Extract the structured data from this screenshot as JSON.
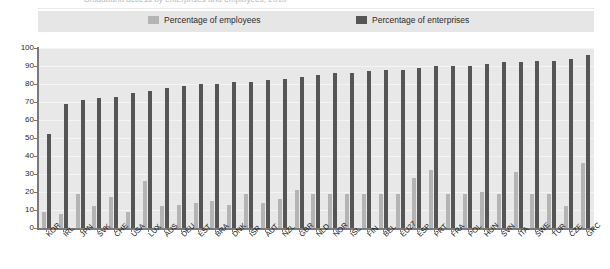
{
  "figure": {
    "cut_off_title": "Broadband access by enterprises and employees, 2010",
    "legend": [
      {
        "label": "Percentage of employees",
        "color": "#b4b4b4",
        "key": "employees"
      },
      {
        "label": "Percentage of enterprises",
        "color": "#555555",
        "key": "enterprises"
      }
    ]
  },
  "chart_data": {
    "type": "bar",
    "title": "Broadband access by enterprises and employees, 2010",
    "xlabel": "",
    "ylabel": "",
    "ylim": [
      0,
      100
    ],
    "yticks": [
      0,
      10,
      20,
      30,
      40,
      50,
      60,
      70,
      80,
      90,
      100
    ],
    "ytick_labels": [
      "0",
      "10",
      "20",
      "30",
      "40",
      "50",
      "60",
      "70",
      "80",
      "90",
      "100"
    ],
    "grid": true,
    "legend_position": "top",
    "categories": [
      "KOR",
      "IRL",
      "JPN",
      "SVK",
      "CHE",
      "USA",
      "LUX",
      "AUS",
      "DEU",
      "EST",
      "BRA",
      "DNK",
      "ISR",
      "AUT",
      "NZL",
      "GBR",
      "NLD",
      "NOR",
      "ISL",
      "FIN",
      "BEL",
      "EU27",
      "ESP",
      "PRT",
      "FRA",
      "POL",
      "HUN",
      "SVN",
      "ITA",
      "SWE",
      "TUR",
      "CZE",
      "GRC"
    ],
    "series": [
      {
        "name": "Percentage of employees",
        "color": "#b4b4b4",
        "values": [
          9,
          8,
          19,
          12,
          17,
          9,
          26,
          12,
          13,
          14,
          15,
          13,
          19,
          14,
          16,
          21,
          19,
          19,
          19,
          19,
          19,
          19,
          28,
          32,
          19,
          19,
          20,
          19,
          31,
          19,
          19,
          12,
          36
        ]
      },
      {
        "name": "Percentage of enterprises",
        "color": "#555555",
        "values": [
          52,
          69,
          71,
          72,
          73,
          75,
          76,
          78,
          79,
          80,
          80,
          81,
          81,
          82,
          83,
          84,
          85,
          86,
          86,
          87,
          88,
          88,
          89,
          90,
          90,
          90,
          91,
          92,
          92,
          93,
          93,
          94,
          96
        ]
      }
    ]
  }
}
